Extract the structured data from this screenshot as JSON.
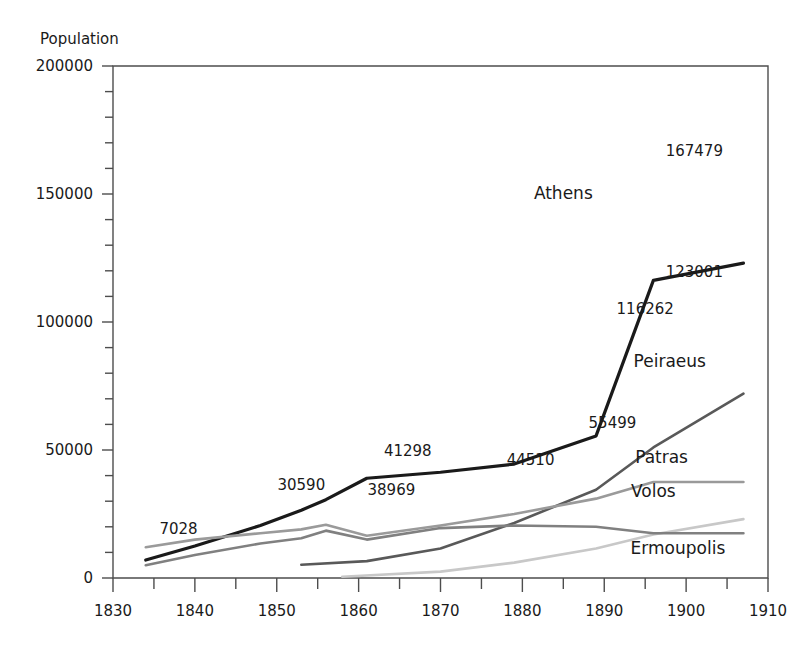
{
  "chart_data": {
    "type": "line",
    "title": "",
    "xlabel": "",
    "ylabel": "Population",
    "xlim": [
      1830,
      1910
    ],
    "ylim": [
      0,
      200000
    ],
    "grid": false,
    "legend_position": "inline-right-end-labels",
    "x_ticks": [
      1830,
      1840,
      1850,
      1860,
      1870,
      1880,
      1890,
      1900,
      1910
    ],
    "x_tick_labels": [
      "1830",
      "1840",
      "1850",
      "1860",
      "1870",
      "1880",
      "1890",
      "1900",
      "1910"
    ],
    "x_minor_step": 5,
    "y_ticks": [
      0,
      50000,
      100000,
      150000,
      200000
    ],
    "y_tick_labels": [
      "0",
      "50000",
      "100000",
      "150000",
      "200000"
    ],
    "y_minor_step": 10000,
    "series": [
      {
        "name": "Athens",
        "color": "#1a1a1a",
        "width": 3.2,
        "x": [
          1834,
          1840,
          1848,
          1853,
          1856,
          1861,
          1870,
          1879,
          1889,
          1896,
          1907
        ],
        "values": [
          7028,
          12000,
          20000,
          26000,
          30590,
          38969,
          41298,
          44510,
          55499,
          116262,
          123001
        ],
        "points": [
          {
            "x": 1834,
            "y": 7028
          },
          {
            "x": 1840,
            "y": 12500
          },
          {
            "x": 1848,
            "y": 20500
          },
          {
            "x": 1853,
            "y": 26500
          },
          {
            "x": 1856,
            "y": 30590
          },
          {
            "x": 1861,
            "y": 38969
          },
          {
            "x": 1870,
            "y": 41298
          },
          {
            "x": 1879,
            "y": 44510
          },
          {
            "x": 1889,
            "y": 55499
          },
          {
            "x": 1896,
            "y": 116262
          },
          {
            "x": 1907,
            "y": 123001
          }
        ]
      },
      {
        "name": "Peiraeus",
        "color": "#595959",
        "width": 2.6,
        "points": [
          {
            "x": 1853,
            "y": 5200
          },
          {
            "x": 1861,
            "y": 6600
          },
          {
            "x": 1870,
            "y": 11500
          },
          {
            "x": 1879,
            "y": 21500
          },
          {
            "x": 1889,
            "y": 34500
          },
          {
            "x": 1896,
            "y": 51000
          },
          {
            "x": 1907,
            "y": 72000
          }
        ]
      },
      {
        "name": "Patras",
        "color": "#9a9a9a",
        "width": 2.6,
        "points": [
          {
            "x": 1834,
            "y": 12000
          },
          {
            "x": 1840,
            "y": 15000
          },
          {
            "x": 1848,
            "y": 17500
          },
          {
            "x": 1853,
            "y": 19000
          },
          {
            "x": 1856,
            "y": 20800
          },
          {
            "x": 1861,
            "y": 16500
          },
          {
            "x": 1870,
            "y": 20500
          },
          {
            "x": 1879,
            "y": 25000
          },
          {
            "x": 1889,
            "y": 31000
          },
          {
            "x": 1896,
            "y": 37500
          },
          {
            "x": 1907,
            "y": 37500
          }
        ]
      },
      {
        "name": "Volos",
        "color": "#c8c8c8",
        "width": 2.6,
        "points": [
          {
            "x": 1858,
            "y": 500
          },
          {
            "x": 1870,
            "y": 2500
          },
          {
            "x": 1879,
            "y": 6000
          },
          {
            "x": 1889,
            "y": 11500
          },
          {
            "x": 1896,
            "y": 17000
          },
          {
            "x": 1907,
            "y": 23000
          }
        ]
      },
      {
        "name": "Ermoupolis",
        "color": "#808080",
        "width": 2.6,
        "points": [
          {
            "x": 1834,
            "y": 5000
          },
          {
            "x": 1840,
            "y": 9000
          },
          {
            "x": 1848,
            "y": 13500
          },
          {
            "x": 1853,
            "y": 15500
          },
          {
            "x": 1856,
            "y": 18500
          },
          {
            "x": 1861,
            "y": 15000
          },
          {
            "x": 1870,
            "y": 19500
          },
          {
            "x": 1879,
            "y": 20500
          },
          {
            "x": 1889,
            "y": 20000
          },
          {
            "x": 1896,
            "y": 17500
          },
          {
            "x": 1907,
            "y": 17500
          }
        ]
      }
    ],
    "point_labels": [
      {
        "text": "7028",
        "x": 1838,
        "y": 17000,
        "anchor": "middle"
      },
      {
        "text": "30590",
        "x": 1853,
        "y": 34500,
        "anchor": "middle"
      },
      {
        "text": "38969",
        "x": 1864,
        "y": 32500,
        "anchor": "middle"
      },
      {
        "text": "41298",
        "x": 1866,
        "y": 47500,
        "anchor": "middle"
      },
      {
        "text": "44510",
        "x": 1881,
        "y": 44000,
        "anchor": "middle"
      },
      {
        "text": "55499",
        "x": 1891,
        "y": 58500,
        "anchor": "middle"
      },
      {
        "text": "116262",
        "x": 1895,
        "y": 103000,
        "anchor": "middle"
      },
      {
        "text": "123001",
        "x": 1901,
        "y": 117500,
        "anchor": "middle"
      },
      {
        "text": "167479",
        "x": 1901,
        "y": 165000,
        "anchor": "middle"
      }
    ],
    "series_labels": [
      {
        "text": "Athens",
        "x": 1885,
        "y": 148000,
        "anchor": "middle"
      },
      {
        "text": "Peiraeus",
        "x": 1898,
        "y": 82500,
        "anchor": "middle"
      },
      {
        "text": "Patras",
        "x": 1897,
        "y": 45000,
        "anchor": "middle"
      },
      {
        "text": "Volos",
        "x": 1896,
        "y": 31500,
        "anchor": "middle"
      },
      {
        "text": "Ermoupolis",
        "x": 1899,
        "y": 9500,
        "anchor": "middle"
      }
    ]
  },
  "axis": {
    "y_title": "Population"
  },
  "colors": {
    "athens": "#1a1a1a",
    "peiraeus": "#595959",
    "patras": "#9a9a9a",
    "volos": "#c8c8c8",
    "ermoupolis": "#808080",
    "axis": "#4d4d4d",
    "background": "#ffffff"
  }
}
